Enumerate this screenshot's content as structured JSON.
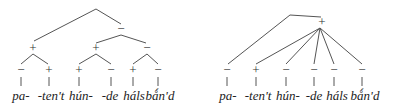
{
  "diagram": {
    "type": "prosodic-tree-comparison",
    "trees": [
      {
        "id": "left-tree",
        "structure": "binary-branching",
        "root": {
          "x": 96,
          "y": 9
        },
        "internal_nodes": [
          {
            "label": "+",
            "x": 33,
            "y": 48,
            "parent": "root"
          },
          {
            "label": "−",
            "x": 120,
            "y": 29,
            "parent": "root"
          },
          {
            "label": "+",
            "x": 95,
            "y": 48,
            "parent": "−"
          },
          {
            "label": "−",
            "x": 145,
            "y": 48,
            "parent": "−"
          }
        ],
        "leaves": [
          {
            "mark": "−",
            "word": "pa-",
            "x": 21
          },
          {
            "mark": "+",
            "word": "-ten't",
            "x": 49
          },
          {
            "mark": "+",
            "word": "hún-",
            "x": 79
          },
          {
            "mark": "−",
            "word": "-de",
            "x": 111
          },
          {
            "mark": "+",
            "word": "háls",
            "x": 133
          },
          {
            "mark": "−",
            "word": "bǻn'd",
            "x": 157
          }
        ]
      },
      {
        "id": "right-tree",
        "structure": "flat-branching",
        "root": {
          "x": 290,
          "y": 15
        },
        "internal_nodes": [
          {
            "label": "+",
            "x": 322,
            "y": 22,
            "parent": "root"
          }
        ],
        "leaves": [
          {
            "mark": "−",
            "word": "pa-",
            "x": 227
          },
          {
            "mark": "+",
            "word": "-ten't",
            "x": 256
          },
          {
            "mark": "−",
            "word": "hún-",
            "x": 286
          },
          {
            "mark": "−",
            "word": "-de",
            "x": 314
          },
          {
            "mark": "−",
            "word": "háls",
            "x": 334
          },
          {
            "mark": "−",
            "word": "bǻn'd",
            "x": 362
          }
        ]
      }
    ]
  },
  "left": {
    "n1": "+",
    "n2": "−",
    "n3": "+",
    "n4": "−",
    "marks": [
      "−",
      "+",
      "+",
      "−",
      "+",
      "−"
    ],
    "words": [
      "pa-",
      "-ten't",
      "hún-",
      "-de",
      "háls",
      "bǻn'd"
    ]
  },
  "right": {
    "n1": "+",
    "marks": [
      "−",
      "+",
      "−",
      "−",
      "−",
      "−"
    ],
    "words": [
      "pa-",
      "-ten't",
      "hún-",
      "-de",
      "háls",
      "bǻn'd"
    ]
  }
}
